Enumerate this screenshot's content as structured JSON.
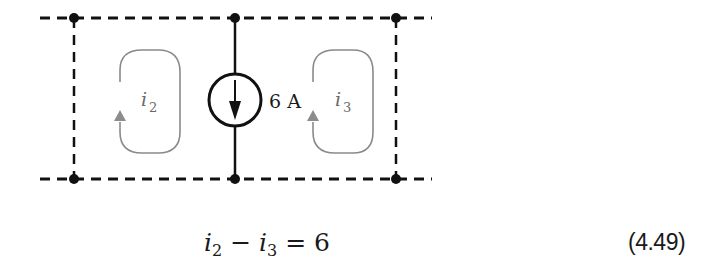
{
  "diagram": {
    "source": {
      "value_label": "6 A",
      "direction": "down"
    },
    "meshes": [
      {
        "name": "i",
        "subscript": "2",
        "direction": "clockwise-up-arrow"
      },
      {
        "name": "i",
        "subscript": "3",
        "direction": "clockwise-up-arrow"
      }
    ],
    "colors": {
      "wire": "#111111",
      "mesh_loop": "#8a8a8a",
      "mesh_arrow": "#8c8c8c",
      "text": "#1a1a1a"
    }
  },
  "equation": {
    "lhs_a": "i",
    "lhs_a_sub": "2",
    "op": " − ",
    "lhs_b": "i",
    "lhs_b_sub": "3",
    "rel": " = ",
    "rhs": "6",
    "number": "(4.49)"
  }
}
